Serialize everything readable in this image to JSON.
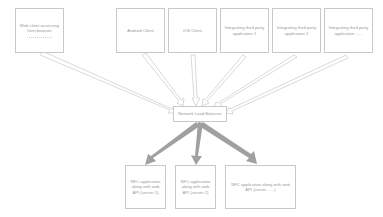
{
  "diagram": {
    "clients": [
      {
        "label": "Web client accessing from browser",
        "x": 15,
        "y": 8,
        "w": 49,
        "h": 45,
        "dotted": true
      },
      {
        "label": "Android Client",
        "x": 116,
        "y": 8,
        "w": 49,
        "h": 45
      },
      {
        "label": "iOS Client",
        "x": 168,
        "y": 8,
        "w": 49,
        "h": 45
      },
      {
        "label": "Integrating third party application 1",
        "x": 220,
        "y": 8,
        "w": 49,
        "h": 45
      },
      {
        "label": "Integrating third party application 2",
        "x": 272,
        "y": 8,
        "w": 49,
        "h": 45
      },
      {
        "label": "Integrating third party application ......",
        "x": 324,
        "y": 8,
        "w": 49,
        "h": 45
      }
    ],
    "load_balancer": {
      "label": "Network Load Balancer",
      "x": 173,
      "y": 106,
      "w": 54,
      "h": 16
    },
    "servers": [
      {
        "label": "NFC application along with web API (server 1)",
        "x": 125,
        "y": 165,
        "w": 41,
        "h": 44
      },
      {
        "label": "NFC application along with web API (server 2)",
        "x": 175,
        "y": 165,
        "w": 41,
        "h": 44
      },
      {
        "label": "NFC application along with web API (server ......)",
        "x": 225,
        "y": 165,
        "w": 71,
        "h": 44
      }
    ],
    "colors": {
      "box_border": "#c8c8c8",
      "text": "#9a9a9a",
      "thin_arrow": "#cfcfcf",
      "thick_arrow": "#a0a0a0"
    }
  }
}
